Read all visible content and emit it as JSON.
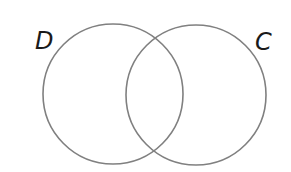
{
  "diagram": {
    "type": "venn",
    "sets": [
      {
        "label": "D",
        "cx": 113,
        "cy": 94,
        "r": 70
      },
      {
        "label": "C",
        "cx": 196,
        "cy": 95,
        "r": 70
      }
    ],
    "stroke_color": "#808080",
    "background": "#ffffff"
  }
}
